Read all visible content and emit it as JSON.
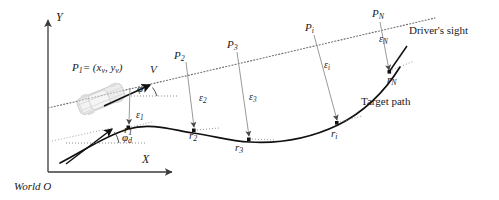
{
  "figure": {
    "background": "#ffffff",
    "width": 499,
    "height": 200
  },
  "colors": {
    "ink": "#1a1a1a",
    "axis": "#3b3b3b",
    "path": "#111111",
    "sight": "#6b6b6b",
    "epsilon": "#8a8a8a",
    "vehicle": "#c9c9c9",
    "vehicle_line": "#a8a8a8"
  },
  "axes": {
    "y_label": "Y",
    "x_label": "X",
    "origin_label": "World O"
  },
  "annotations": {
    "drivers_sight": "Driver's sight",
    "target_path": "Target path",
    "velocity": "V",
    "vehicle_position_equation": {
      "symbol": "P",
      "symbol_sub": "1",
      "equals": "= (",
      "x_term": "x",
      "x_sub": "v",
      "comma": ", ",
      "y_term": "y",
      "y_sub": "v",
      "close": ")",
      "full_text": "P₁ = (xᵥ, yᵥ)"
    },
    "heading_angle": {
      "symbol": "φ",
      "sub": ""
    },
    "desired_heading_angle": {
      "symbol": "φ",
      "sub": "d"
    }
  },
  "preview_points": [
    {
      "name": "P",
      "sub": "1",
      "x": 130,
      "y": 86
    },
    {
      "name": "P",
      "sub": "2",
      "x": 180,
      "y": 57
    },
    {
      "name": "P",
      "sub": "3",
      "x": 233,
      "y": 46
    },
    {
      "name": "P",
      "sub": "i",
      "x": 311,
      "y": 29
    },
    {
      "name": "P",
      "sub": "N",
      "x": 378,
      "y": 15
    }
  ],
  "path_points": [
    {
      "name": "r",
      "sub": "1",
      "x": 128,
      "y": 129
    },
    {
      "name": "r",
      "sub": "2",
      "x": 193,
      "y": 133
    },
    {
      "name": "r",
      "sub": "3",
      "x": 239,
      "y": 141
    },
    {
      "name": "r",
      "sub": "i",
      "x": 335,
      "y": 129
    },
    {
      "name": "r",
      "sub": "N",
      "x": 391,
      "y": 77
    }
  ],
  "errors": [
    {
      "name": "ε",
      "sub": "1",
      "x": 140,
      "y": 116
    },
    {
      "name": "ε",
      "sub": "2",
      "x": 203,
      "y": 99
    },
    {
      "name": "ε",
      "sub": "3",
      "x": 253,
      "y": 98
    },
    {
      "name": "ε",
      "sub": "i",
      "x": 328,
      "y": 66
    },
    {
      "name": "ε",
      "sub": "N",
      "x": 383,
      "y": 40
    }
  ],
  "geometry": {
    "y_axis": {
      "x": 48,
      "y_top": 18,
      "y_bottom": 172
    },
    "x_axis": {
      "y": 172,
      "x_left": 48,
      "x_right": 175
    },
    "sight_line": {
      "x1": 48,
      "y1": 108,
      "x2": 435,
      "y2": 18
    },
    "target_path": "M 60,163 C 85,150 105,136 128,129 C 152,122 176,131 193,133 C 216,136 228,141 250,142 C 285,144 315,136 338,125 C 362,113 382,96 400,67",
    "velocity_arrow": {
      "x1": 108,
      "y1": 104,
      "x2": 152,
      "y2": 84
    },
    "phi_ref": {
      "x1": 131,
      "y1": 96,
      "x2": 176,
      "y2": 96
    },
    "phid_arrow": {
      "x1": 69,
      "y1": 161,
      "x2": 113,
      "y2": 128
    },
    "phid_ref": {
      "x1": 70,
      "y1": 143,
      "x2": 143,
      "y2": 143
    },
    "vehicle": {
      "cx": 101,
      "cy": 99,
      "angle": -22
    }
  }
}
